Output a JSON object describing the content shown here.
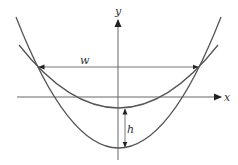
{
  "diagram": {
    "axes": {
      "x_label": "x",
      "y_label": "y"
    },
    "curves": [
      {
        "name": "steep-parabola",
        "vertex": [
          118.5,
          148
        ],
        "ends": [
          [
            16,
            17
          ],
          [
            221,
            17
          ]
        ]
      },
      {
        "name": "flat-parabola",
        "vertex": [
          118.5,
          108
        ],
        "ends": [
          [
            19,
            45
          ],
          [
            218,
            45
          ]
        ]
      }
    ],
    "annotations": {
      "width_label": "w",
      "height_label": "h"
    },
    "colors": {
      "stroke": "#555555",
      "background": "#ffffff"
    }
  }
}
